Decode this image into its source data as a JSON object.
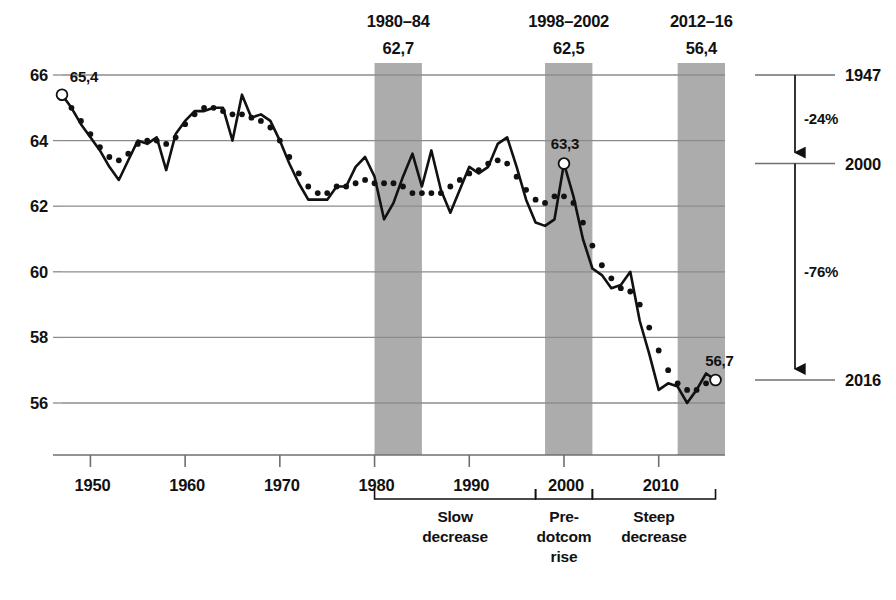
{
  "chart_data": {
    "type": "line",
    "title": "",
    "xlabel": "",
    "ylabel": "",
    "xlim": [
      1947,
      2017
    ],
    "ylim": [
      55.0,
      66.4
    ],
    "grid": "horizontal",
    "legend": "none",
    "y_ticks": [
      "66",
      "64",
      "62",
      "60",
      "58",
      "56"
    ],
    "y_tick_values": [
      66,
      64,
      62,
      60,
      58,
      56
    ],
    "x_ticks": [
      "1950",
      "1960",
      "1970",
      "1980",
      "1990",
      "2000",
      "2010"
    ],
    "x_tick_values": [
      1950,
      1960,
      1970,
      1980,
      1990,
      2000,
      2010
    ],
    "x": [
      1947,
      1948,
      1949,
      1950,
      1951,
      1952,
      1953,
      1954,
      1955,
      1956,
      1957,
      1958,
      1959,
      1960,
      1961,
      1962,
      1963,
      1964,
      1965,
      1966,
      1967,
      1968,
      1969,
      1970,
      1971,
      1972,
      1973,
      1974,
      1975,
      1976,
      1977,
      1978,
      1979,
      1980,
      1981,
      1982,
      1983,
      1984,
      1985,
      1986,
      1987,
      1988,
      1989,
      1990,
      1991,
      1992,
      1993,
      1994,
      1995,
      1996,
      1997,
      1998,
      1999,
      2000,
      2001,
      2002,
      2003,
      2004,
      2005,
      2006,
      2007,
      2008,
      2009,
      2010,
      2011,
      2012,
      2013,
      2014,
      2015,
      2016
    ],
    "series": [
      {
        "name": "annual",
        "style": "solid-line",
        "values": [
          65.4,
          65.0,
          64.5,
          64.1,
          63.7,
          63.2,
          62.8,
          63.4,
          64.0,
          63.9,
          64.1,
          63.1,
          64.2,
          64.6,
          64.9,
          64.9,
          65.0,
          65.0,
          64.0,
          65.4,
          64.7,
          64.8,
          64.6,
          64.0,
          63.3,
          62.7,
          62.2,
          62.2,
          62.2,
          62.6,
          62.6,
          63.2,
          63.5,
          62.9,
          61.6,
          62.1,
          62.9,
          63.6,
          62.6,
          63.7,
          62.5,
          61.8,
          62.5,
          63.2,
          63.0,
          63.2,
          63.9,
          64.1,
          63.2,
          62.2,
          61.5,
          61.4,
          61.6,
          63.3,
          62.3,
          61.0,
          60.1,
          59.9,
          59.5,
          59.6,
          60.0,
          58.5,
          57.5,
          56.4,
          56.6,
          56.5,
          56.0,
          56.4,
          56.9,
          56.7
        ]
      },
      {
        "name": "trend",
        "style": "dotted",
        "values": [
          65.3,
          65.0,
          64.6,
          64.2,
          63.8,
          63.5,
          63.4,
          63.6,
          63.9,
          64.0,
          64.0,
          63.9,
          64.1,
          64.5,
          64.8,
          65.0,
          65.0,
          64.9,
          64.8,
          64.8,
          64.7,
          64.6,
          64.4,
          64.0,
          63.5,
          63.0,
          62.6,
          62.4,
          62.4,
          62.6,
          62.6,
          62.7,
          62.8,
          62.7,
          62.7,
          62.7,
          62.6,
          62.4,
          62.4,
          62.4,
          62.4,
          62.6,
          62.8,
          63.0,
          63.1,
          63.3,
          63.4,
          63.3,
          62.9,
          62.5,
          62.2,
          62.1,
          62.3,
          62.3,
          62.1,
          61.5,
          60.8,
          60.2,
          59.8,
          59.5,
          59.4,
          59.0,
          58.3,
          57.6,
          57.0,
          56.6,
          56.4,
          56.4,
          56.6,
          56.7
        ]
      }
    ],
    "highlight_bands": [
      {
        "label": "1980–84",
        "value": "62,7",
        "x_start": 1980,
        "x_end": 1985
      },
      {
        "label": "1998–2002",
        "value": "62,5",
        "x_start": 1998,
        "x_end": 2003
      },
      {
        "label": "2012–16",
        "value": "56,4",
        "x_start": 2012,
        "x_end": 2017
      }
    ],
    "point_annotations": [
      {
        "label": "65,4",
        "x": 1947,
        "y": 65.4,
        "marker": "open-circle"
      },
      {
        "label": "63,3",
        "x": 2000,
        "y": 63.3,
        "marker": "open-circle"
      },
      {
        "label": "56,7",
        "x": 2016,
        "y": 56.7,
        "marker": "open-circle"
      }
    ],
    "period_brackets": [
      {
        "label_lines": [
          "Slow",
          "decrease"
        ],
        "x_start": 1980,
        "x_end": 1997
      },
      {
        "label_lines": [
          "Pre-",
          "dotcom",
          "rise"
        ],
        "x_start": 1997,
        "x_end": 2003
      },
      {
        "label_lines": [
          "Steep",
          "decrease"
        ],
        "x_start": 2003,
        "x_end": 2016
      }
    ],
    "change_panel": {
      "ticks": [
        {
          "label": "1947",
          "y": 66.0
        },
        {
          "label": "2000",
          "y": 63.3
        },
        {
          "label": "2016",
          "y": 56.7
        }
      ],
      "segments": [
        {
          "label": "-24%",
          "from": "1947",
          "to": "2000"
        },
        {
          "label": "-76%",
          "from": "2000",
          "to": "2016"
        }
      ]
    },
    "colors": {
      "line": "#111111",
      "band_fill": "#a8a8a8",
      "grid": "#8c8c8c",
      "axis": "#6f6f6f",
      "text": "#111111"
    }
  }
}
